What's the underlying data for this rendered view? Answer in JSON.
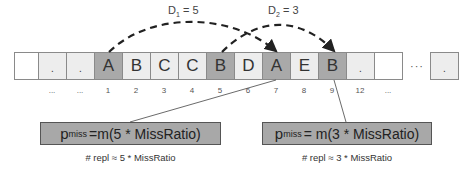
{
  "diagram": {
    "distances": [
      {
        "symbol": "D",
        "subscript": "1",
        "equals": "=",
        "value": "5",
        "from_index": "1",
        "to_index": "7",
        "letter": "A"
      },
      {
        "symbol": "D",
        "subscript": "2",
        "equals": "=",
        "value": "3",
        "from_index": "5",
        "to_index": "9",
        "letter": "B"
      }
    ],
    "cells": [
      {
        "label": "",
        "shade": "white",
        "index": ""
      },
      {
        "label": ".",
        "shade": "light",
        "index": "..."
      },
      {
        "label": ".",
        "shade": "light",
        "index": "..."
      },
      {
        "label": "A",
        "shade": "dark",
        "index": "1"
      },
      {
        "label": "B",
        "shade": "light",
        "index": "2"
      },
      {
        "label": "C",
        "shade": "light",
        "index": "3"
      },
      {
        "label": "C",
        "shade": "light",
        "index": "4"
      },
      {
        "label": "B",
        "shade": "dark",
        "index": "5"
      },
      {
        "label": "D",
        "shade": "light",
        "index": "6"
      },
      {
        "label": "A",
        "shade": "dark",
        "index": "7"
      },
      {
        "label": "E",
        "shade": "light",
        "index": "8"
      },
      {
        "label": "B",
        "shade": "dark",
        "index": "9"
      },
      {
        "label": ".",
        "shade": "light",
        "index": "12"
      },
      {
        "label": "",
        "shade": "white",
        "index": "..."
      }
    ],
    "gap_ellipsis": "···",
    "tail_cell": {
      "label": ".",
      "shade": "light"
    },
    "formulas": [
      {
        "p": "p",
        "sub": "miss",
        "rest": "=m(5 * MissRatio)",
        "repl": "# repl ≈ 5 * MissRatio"
      },
      {
        "p": "p",
        "sub": "miss",
        "rest": "= m(3 * MissRatio)",
        "repl": "# repl ≈ 3 * MissRatio"
      }
    ],
    "colors": {
      "dark_cell": "#a9a9a9",
      "light_cell": "#ededed",
      "formula_box": "#a8a8a8",
      "arrow": "#222222"
    }
  }
}
